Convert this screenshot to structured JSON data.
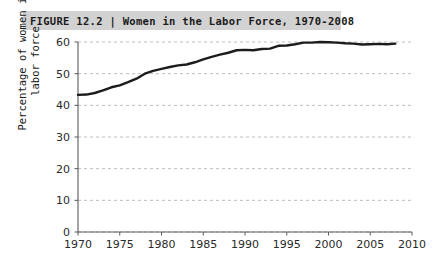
{
  "figure": {
    "title": "FIGURE 12.2 | Women in the Labor Force, 1970-2008",
    "title_bar_color": "#d2d2d2"
  },
  "chart_data": {
    "type": "line",
    "title": "FIGURE 12.2 | Women in the Labor Force, 1970-2008",
    "xlabel": "",
    "ylabel": "Percentage of women in\nlabor force",
    "xlim": [
      1970,
      2010
    ],
    "ylim": [
      0,
      60
    ],
    "xticks": [
      1970,
      1975,
      1980,
      1985,
      1990,
      1995,
      2000,
      2005,
      2010
    ],
    "yticks": [
      0,
      10,
      20,
      30,
      40,
      50,
      60
    ],
    "grid": "horizontal-dashed",
    "legend": "none",
    "line_color": "#1c1c1c",
    "line_width": 2.4,
    "x": [
      1970,
      1971,
      1972,
      1973,
      1974,
      1975,
      1976,
      1977,
      1978,
      1979,
      1980,
      1981,
      1982,
      1983,
      1984,
      1985,
      1986,
      1987,
      1988,
      1989,
      1990,
      1991,
      1992,
      1993,
      1994,
      1995,
      1996,
      1997,
      1998,
      1999,
      2000,
      2001,
      2002,
      2003,
      2004,
      2005,
      2006,
      2007,
      2008
    ],
    "values": [
      43.3,
      43.4,
      43.9,
      44.7,
      45.7,
      46.3,
      47.3,
      48.4,
      50.0,
      50.9,
      51.5,
      52.1,
      52.6,
      52.9,
      53.6,
      54.5,
      55.3,
      56.0,
      56.6,
      57.4,
      57.5,
      57.4,
      57.8,
      57.9,
      58.8,
      58.9,
      59.3,
      59.8,
      59.8,
      60.0,
      59.9,
      59.8,
      59.6,
      59.5,
      59.2,
      59.3,
      59.4,
      59.3,
      59.5
    ]
  }
}
